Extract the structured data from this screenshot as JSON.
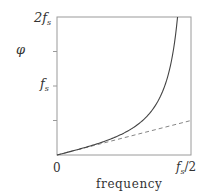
{
  "chart_data": {
    "type": "line",
    "title": "",
    "xlabel": "frequency",
    "ylabel": "φ",
    "xlim": [
      0,
      0.5
    ],
    "ylim": [
      0,
      2
    ],
    "x_units": "f_s",
    "y_units": "f_s",
    "x_ticks": [
      {
        "value": 0,
        "label": "0"
      },
      {
        "value": 0.5,
        "label": "f_s/2"
      }
    ],
    "y_ticks": [
      {
        "value": 0,
        "label": ""
      },
      {
        "value": 0.5,
        "label": ""
      },
      {
        "value": 1,
        "label": "f_s"
      },
      {
        "value": 1.5,
        "label": ""
      },
      {
        "value": 2,
        "label": "2f_s"
      }
    ],
    "grid": false,
    "legend": null,
    "series": [
      {
        "name": "warped frequency (solid)",
        "style": "solid",
        "formula": "phi = (f_s/pi) * tan(pi * f / f_s)",
        "x": [
          0,
          0.05,
          0.1,
          0.15,
          0.2,
          0.25,
          0.3,
          0.35,
          0.4,
          0.42,
          0.44,
          0.4498
        ],
        "y": [
          0,
          0.05,
          0.103,
          0.162,
          0.231,
          0.318,
          0.438,
          0.625,
          0.98,
          1.221,
          1.599,
          2.0
        ]
      },
      {
        "name": "linear reference (dashed)",
        "style": "dashed",
        "formula": "phi = f",
        "x": [
          0,
          0.5
        ],
        "y": [
          0,
          0.5
        ]
      }
    ]
  },
  "labels": {
    "y_axis": "φ",
    "y_top_main": "2f",
    "y_top_sub": "s",
    "y_mid_main": "f",
    "y_mid_sub": "s",
    "x_zero": "0",
    "x_right_main": "f",
    "x_right_sub": "s",
    "x_right_tail": "/2",
    "x_axis": "frequency"
  }
}
